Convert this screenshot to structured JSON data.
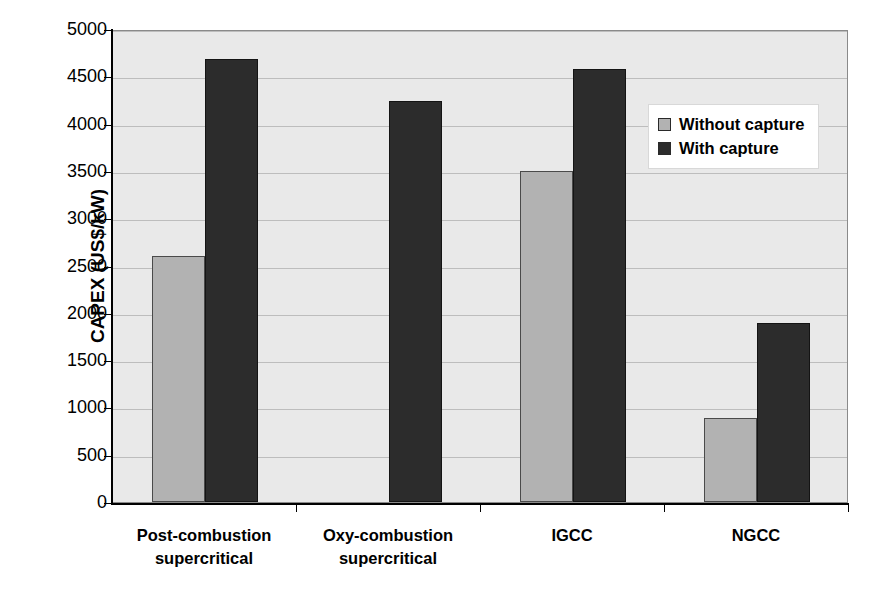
{
  "chart_data": {
    "type": "bar",
    "title": "",
    "xlabel": "",
    "ylabel": "CAPEX (US$/kW)",
    "ylim": [
      0,
      5000
    ],
    "ytick_step": 500,
    "yticks": [
      "5000",
      "4500",
      "4000",
      "3500",
      "3000",
      "2500",
      "2000",
      "1500",
      "1000",
      "500",
      "0"
    ],
    "grid": true,
    "legend_position": "inside-top-right",
    "categories": [
      "Post-combustion supercritical",
      "Oxy-combustion supercritical",
      "IGCC",
      "NGCC"
    ],
    "category_lines": [
      [
        "Post-combustion",
        "supercritical"
      ],
      [
        "Oxy-combustion",
        "supercritical"
      ],
      [
        "IGCC"
      ],
      [
        "NGCC"
      ]
    ],
    "series": [
      {
        "name": "Without capture",
        "color": "#b2b2b2",
        "values": [
          2600,
          null,
          3500,
          890
        ]
      },
      {
        "name": "With capture",
        "color": "#2c2c2c",
        "values": [
          4680,
          4240,
          4580,
          1890
        ]
      }
    ]
  },
  "legend": {
    "items": [
      {
        "label": "Without capture",
        "swatch": "light"
      },
      {
        "label": "With capture",
        "swatch": "dark"
      }
    ]
  },
  "colors": {
    "plot_background": "#e9e9e9",
    "gridline": "#bdbdbd",
    "axis": "#000000",
    "without_capture": "#b2b2b2",
    "with_capture": "#2c2c2c",
    "page_background": "#ffffff"
  }
}
